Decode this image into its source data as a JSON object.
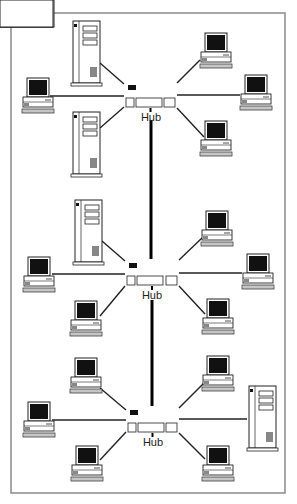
{
  "diagram": {
    "title": "",
    "frame": {
      "x": 11,
      "y": 13,
      "w": 274,
      "h": 480,
      "color": "#8a8a8a"
    },
    "colors": {
      "line": "#222222",
      "fill": "#ffffff",
      "screen": "#111111",
      "frame": "#8a8a8a"
    },
    "hubs": [
      {
        "id": "hub1",
        "label": "Hub",
        "x": 124,
        "y": 81,
        "w": 53,
        "h": 27,
        "label_x": 151,
        "label_y": 111
      },
      {
        "id": "hub2",
        "label": "Hub",
        "x": 125,
        "y": 259,
        "w": 54,
        "h": 27,
        "label_x": 152,
        "label_y": 289
      },
      {
        "id": "hub3",
        "label": "Hub",
        "x": 126,
        "y": 406,
        "w": 53,
        "h": 27,
        "label_x": 153,
        "label_y": 436
      }
    ],
    "backbone": [
      {
        "from": "hub1",
        "to": "hub2",
        "x": 151,
        "y1": 120,
        "y2": 259
      },
      {
        "from": "hub2",
        "to": "hub3",
        "x": 152,
        "y1": 300,
        "y2": 406
      }
    ],
    "nodes": [
      {
        "id": "s1",
        "type": "server",
        "x": 71,
        "y": 21,
        "hub": "hub1",
        "lx": 100,
        "ly": 63,
        "hx": 124,
        "hy": 84
      },
      {
        "id": "s2",
        "type": "server",
        "x": 71,
        "y": 112,
        "hub": "hub1",
        "lx": 100,
        "ly": 128,
        "hx": 124,
        "hy": 107
      },
      {
        "id": "w1",
        "type": "workstation",
        "x": 22,
        "y": 78,
        "hub": "hub1",
        "lx": 50,
        "ly": 96,
        "hx": 124,
        "hy": 96
      },
      {
        "id": "w2",
        "type": "workstation",
        "x": 200,
        "y": 33,
        "hub": "hub1",
        "lx": 200,
        "ly": 60,
        "hx": 177,
        "hy": 83
      },
      {
        "id": "w3",
        "type": "workstation",
        "x": 240,
        "y": 75,
        "hub": "hub1",
        "lx": 240,
        "ly": 95,
        "hx": 177,
        "hy": 95
      },
      {
        "id": "w4",
        "type": "workstation",
        "x": 200,
        "y": 121,
        "hub": "hub1",
        "lx": 204,
        "ly": 137,
        "hx": 177,
        "hy": 108
      },
      {
        "id": "s3",
        "type": "server",
        "x": 73,
        "y": 200,
        "hub": "hub2",
        "lx": 102,
        "ly": 241,
        "hx": 125,
        "hy": 261
      },
      {
        "id": "w5",
        "type": "workstation",
        "x": 23,
        "y": 257,
        "hub": "hub2",
        "lx": 52,
        "ly": 274,
        "hx": 125,
        "hy": 274
      },
      {
        "id": "w6",
        "type": "workstation",
        "x": 70,
        "y": 301,
        "hub": "hub2",
        "lx": 100,
        "ly": 316,
        "hx": 125,
        "hy": 286
      },
      {
        "id": "w7",
        "type": "workstation",
        "x": 201,
        "y": 211,
        "hub": "hub2",
        "lx": 202,
        "ly": 238,
        "hx": 179,
        "hy": 260
      },
      {
        "id": "w8",
        "type": "workstation",
        "x": 242,
        "y": 254,
        "hub": "hub2",
        "lx": 242,
        "ly": 273,
        "hx": 179,
        "hy": 273
      },
      {
        "id": "w9",
        "type": "workstation",
        "x": 202,
        "y": 299,
        "hub": "hub2",
        "lx": 205,
        "ly": 314,
        "hx": 179,
        "hy": 286
      },
      {
        "id": "w10",
        "type": "workstation",
        "x": 70,
        "y": 358,
        "hub": "hub3",
        "lx": 100,
        "ly": 388,
        "hx": 126,
        "hy": 410
      },
      {
        "id": "w11",
        "type": "workstation",
        "x": 23,
        "y": 402,
        "hub": "hub3",
        "lx": 52,
        "ly": 420,
        "hx": 126,
        "hy": 420
      },
      {
        "id": "w12",
        "type": "workstation",
        "x": 71,
        "y": 446,
        "hub": "hub3",
        "lx": 100,
        "ly": 460,
        "hx": 126,
        "hy": 432
      },
      {
        "id": "w13",
        "type": "workstation",
        "x": 202,
        "y": 356,
        "hub": "hub3",
        "lx": 204,
        "ly": 383,
        "hx": 179,
        "hy": 408
      },
      {
        "id": "s4",
        "type": "server",
        "x": 247,
        "y": 386,
        "hub": "hub3",
        "lx": 247,
        "ly": 419,
        "hx": 179,
        "hy": 419
      },
      {
        "id": "w14",
        "type": "workstation",
        "x": 202,
        "y": 446,
        "hub": "hub3",
        "lx": 205,
        "ly": 459,
        "hx": 179,
        "hy": 433
      }
    ]
  }
}
